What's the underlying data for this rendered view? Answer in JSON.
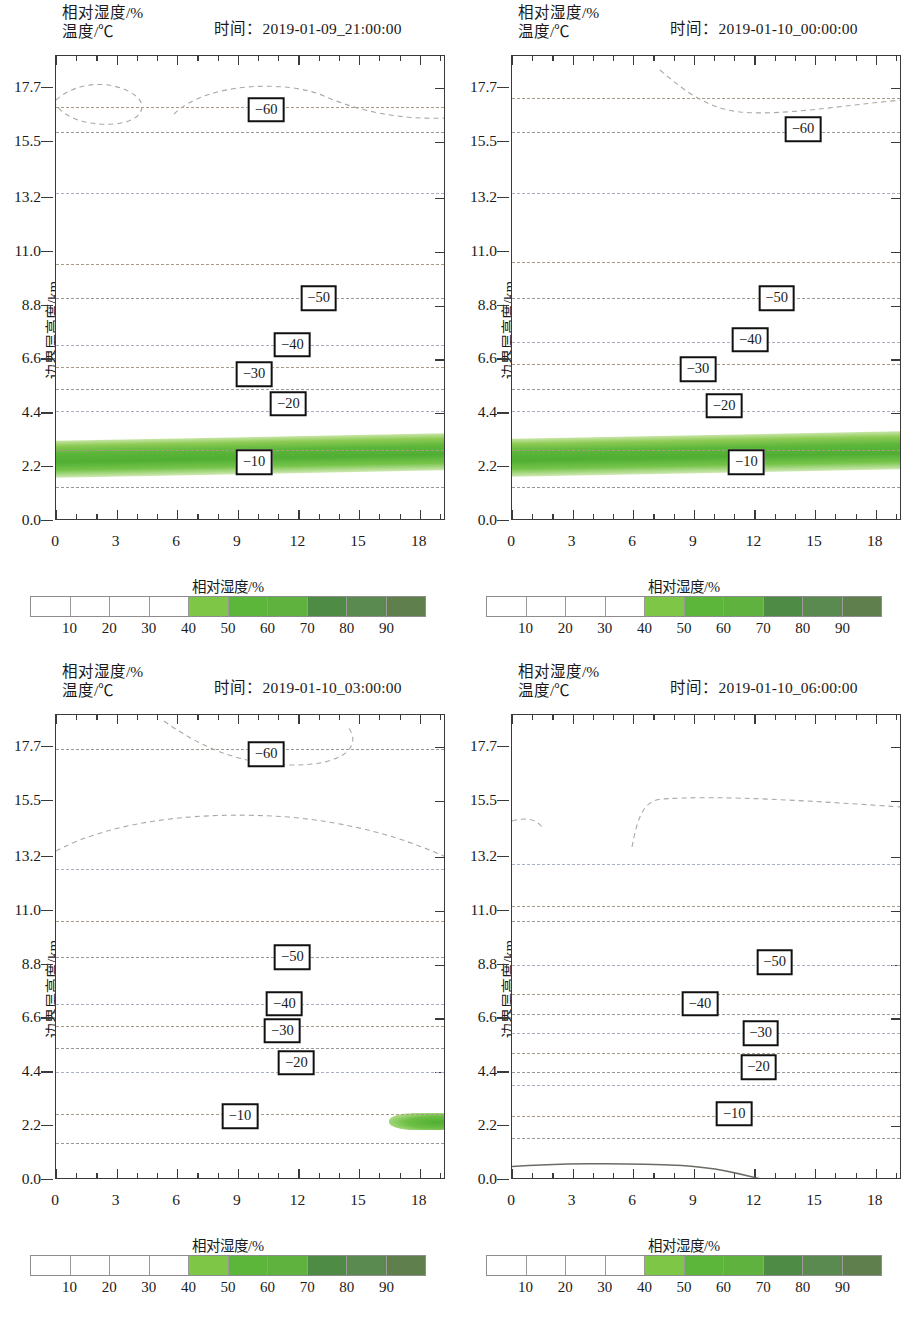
{
  "figure": {
    "header_line1": "相对湿度/%",
    "header_line2": "温度/℃",
    "time_prefix": "时间：",
    "y_axis_title": "边界层高度/km",
    "colorbar_title": "相对湿度/%"
  },
  "axes": {
    "y_ticks": [
      "0.0",
      "2.2",
      "4.4",
      "6.6",
      "8.8",
      "11.0",
      "13.2",
      "15.5",
      "17.7"
    ],
    "y_values": [
      0.0,
      2.2,
      4.4,
      6.6,
      8.8,
      11.0,
      13.2,
      15.5,
      17.7
    ],
    "y_min": 0.0,
    "y_max": 19.0,
    "x_ticks": [
      "0",
      "3",
      "6",
      "9",
      "12",
      "15",
      "18"
    ],
    "x_values": [
      0,
      3,
      6,
      9,
      12,
      15,
      18
    ],
    "x_min": 0,
    "x_max": 19.3
  },
  "colorbar": {
    "title": "相对湿度/%",
    "tick_labels": [
      "10",
      "20",
      "30",
      "40",
      "50",
      "60",
      "70",
      "80",
      "90"
    ],
    "tick_values": [
      10,
      20,
      30,
      40,
      50,
      60,
      70,
      80,
      90
    ],
    "segment_colors": [
      "#ffffff",
      "#ffffff",
      "#ffffff",
      "#ffffff",
      "#7dc646",
      "#5cb63a",
      "#5fb23e",
      "#4e8b45",
      "#5b8a51",
      "#5f7f4c"
    ],
    "range": [
      0,
      100
    ]
  },
  "chart_data": {
    "type": "heatmap",
    "xlabel": "",
    "ylabel": "边界层高度/km",
    "xlim": [
      0,
      19.3
    ],
    "ylim": [
      0.0,
      19.0
    ],
    "grid": false,
    "legend_position": "bottom",
    "contour_variable": "温度/℃",
    "shaded_variable": "相对湿度/%",
    "panels": [
      {
        "id": "panel-1",
        "time": "2019-01-09_21:00:00",
        "contour_labels": [
          {
            "value": "−60",
            "x": 10.4,
            "y": 16.8
          },
          {
            "value": "−50",
            "x": 13.0,
            "y": 9.1
          },
          {
            "value": "−40",
            "x": 11.7,
            "y": 7.2
          },
          {
            "value": "−30",
            "x": 9.8,
            "y": 6.0
          },
          {
            "value": "−20",
            "x": 11.5,
            "y": 4.8
          },
          {
            "value": "−10",
            "x": 9.8,
            "y": 2.4
          }
        ],
        "contour_lines_y": [
          1.4,
          2.9,
          4.5,
          5.4,
          6.3,
          7.2,
          9.1,
          10.5,
          13.4,
          15.9,
          16.9
        ],
        "humidity_band": {
          "present": true,
          "y_bottom": 1.95,
          "y_top": 3.45,
          "core_y": 2.6,
          "max_rh": 70
        },
        "top_closed_contour": true,
        "surface_curve": false
      },
      {
        "id": "panel-2",
        "time": "2019-01-10_00:00:00",
        "contour_labels": [
          {
            "value": "−60",
            "x": 14.4,
            "y": 16.0
          },
          {
            "value": "−50",
            "x": 13.1,
            "y": 9.1
          },
          {
            "value": "−40",
            "x": 11.8,
            "y": 7.4
          },
          {
            "value": "−30",
            "x": 9.2,
            "y": 6.2
          },
          {
            "value": "−20",
            "x": 10.5,
            "y": 4.7
          },
          {
            "value": "−10",
            "x": 11.6,
            "y": 2.4
          }
        ],
        "contour_lines_y": [
          1.4,
          2.9,
          4.5,
          5.4,
          6.4,
          7.3,
          9.1,
          10.6,
          13.4,
          15.9,
          17.3
        ],
        "humidity_band": {
          "present": true,
          "y_bottom": 1.95,
          "y_top": 3.5,
          "core_y": 2.6,
          "max_rh": 70
        },
        "top_closed_contour": true,
        "surface_curve": false
      },
      {
        "id": "panel-3",
        "time": "2019-01-10_03:00:00",
        "contour_labels": [
          {
            "value": "−60",
            "x": 10.4,
            "y": 17.4
          },
          {
            "value": "−50",
            "x": 11.7,
            "y": 9.1
          },
          {
            "value": "−40",
            "x": 11.3,
            "y": 7.2
          },
          {
            "value": "−30",
            "x": 11.2,
            "y": 6.1
          },
          {
            "value": "−20",
            "x": 11.9,
            "y": 4.8
          },
          {
            "value": "−10",
            "x": 9.1,
            "y": 2.6
          }
        ],
        "contour_lines_y": [
          1.5,
          2.7,
          4.4,
          5.4,
          6.3,
          7.2,
          9.1,
          10.6,
          12.7,
          17.6
        ],
        "humidity_band": {
          "present": false
        },
        "humidity_patch": {
          "present": true,
          "x_start": 16.5,
          "x_end": 19.3,
          "y_bottom": 2.05,
          "y_top": 2.75,
          "max_rh": 60
        },
        "top_closed_contour": true,
        "surface_curve": false
      },
      {
        "id": "panel-4",
        "time": "2019-01-10_06:00:00",
        "contour_labels": [
          {
            "value": "−50",
            "x": 13.0,
            "y": 8.9
          },
          {
            "value": "−40",
            "x": 9.3,
            "y": 7.2
          },
          {
            "value": "−30",
            "x": 12.3,
            "y": 6.0
          },
          {
            "value": "−20",
            "x": 12.2,
            "y": 4.6
          },
          {
            "value": "−10",
            "x": 11.0,
            "y": 2.7
          }
        ],
        "contour_lines_y": [
          1.7,
          2.6,
          3.9,
          4.4,
          5.2,
          6.0,
          6.8,
          7.6,
          8.8,
          10.6,
          11.2,
          12.9
        ],
        "humidity_band": {
          "present": false
        },
        "top_closed_contour": false,
        "surface_curve": {
          "present": true,
          "y_peak": 0.55,
          "x_end": 12.4
        }
      }
    ]
  }
}
